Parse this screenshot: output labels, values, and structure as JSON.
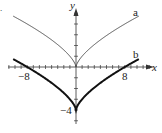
{
  "chart_data": {
    "type": "line",
    "title": "",
    "xlabel": "x",
    "ylabel": "y",
    "xlim": [
      -12.5,
      13.5
    ],
    "ylim": [
      -5,
      5.5
    ],
    "grid": false,
    "ticks": {
      "x_step": 1,
      "y_step": 1
    },
    "tick_labels": {
      "x": [
        "-8",
        "8"
      ],
      "y": [
        "-4"
      ]
    },
    "series": [
      {
        "name": "a",
        "formula": "y = x^(2/3)",
        "style": "thin",
        "x": [
          -10,
          -8,
          -6,
          -4,
          -2,
          -1,
          0,
          1,
          2,
          4,
          6,
          8,
          10
        ],
        "y": [
          4.64,
          4,
          3.3,
          2.52,
          1.59,
          1,
          0,
          1,
          1.59,
          2.52,
          3.3,
          4,
          4.64
        ]
      },
      {
        "name": "b",
        "formula": "y = x^(2/3) - 4",
        "style": "thick",
        "x": [
          -10,
          -8,
          -6,
          -4,
          -2,
          -1,
          0,
          1,
          2,
          4,
          6,
          8,
          10
        ],
        "y": [
          0.64,
          0,
          -0.7,
          -1.48,
          -2.41,
          -3,
          -4,
          -3,
          -2.41,
          -1.48,
          -0.7,
          0,
          0.64
        ]
      }
    ],
    "legend": {
      "position": "inline-curve-labels",
      "entries": [
        "a",
        "b"
      ]
    }
  },
  "labels": {
    "corner": ".",
    "x_axis": "x",
    "y_axis": "y",
    "curve_a": "a",
    "curve_b": "b",
    "x_neg8": "−8",
    "x_pos8": "8",
    "y_neg4": "−4"
  }
}
